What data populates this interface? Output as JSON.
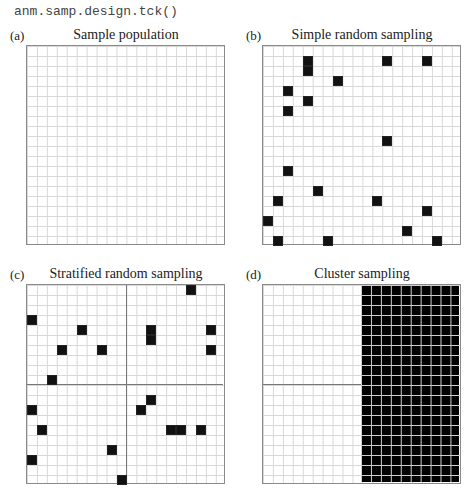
{
  "code_label": "anm.samp.design.tck()",
  "grid": {
    "cols": 20,
    "rows": 20
  },
  "colors": {
    "filled": "#111111",
    "grid_line": "#d8d8d8",
    "frame": "#8a8a8a",
    "divider": "#777777"
  },
  "panels": [
    {
      "letter": "(a)",
      "title": "Sample population",
      "type": "population",
      "cells": []
    },
    {
      "letter": "(b)",
      "title": "Simple random sampling",
      "type": "simple_random",
      "cells": [
        [
          4,
          1
        ],
        [
          4,
          2
        ],
        [
          12,
          1
        ],
        [
          16,
          1
        ],
        [
          7,
          3
        ],
        [
          2,
          4
        ],
        [
          4,
          5
        ],
        [
          2,
          6
        ],
        [
          12,
          9
        ],
        [
          2,
          12
        ],
        [
          5,
          14
        ],
        [
          1,
          15
        ],
        [
          11,
          15
        ],
        [
          16,
          16
        ],
        [
          0,
          17
        ],
        [
          14,
          18
        ],
        [
          1,
          19
        ],
        [
          6,
          19
        ],
        [
          17,
          19
        ]
      ]
    },
    {
      "letter": "(c)",
      "title": "Stratified random sampling",
      "type": "stratified",
      "strata_divider": {
        "col": 10,
        "row": 10
      },
      "cells": [
        [
          16,
          0
        ],
        [
          0,
          3
        ],
        [
          5,
          4
        ],
        [
          12,
          4
        ],
        [
          12,
          5
        ],
        [
          18,
          4
        ],
        [
          3,
          6
        ],
        [
          7,
          6
        ],
        [
          18,
          6
        ],
        [
          2,
          9
        ],
        [
          12,
          11
        ],
        [
          11,
          12
        ],
        [
          0,
          12
        ],
        [
          1,
          14
        ],
        [
          14,
          14
        ],
        [
          15,
          14
        ],
        [
          17,
          14
        ],
        [
          8,
          16
        ],
        [
          0,
          17
        ],
        [
          9,
          19
        ]
      ]
    },
    {
      "letter": "(d)",
      "title": "Cluster sampling",
      "type": "cluster",
      "cluster_divider_row": 10,
      "selected_cluster": {
        "col_start": 10,
        "col_end": 19,
        "row_start": 0,
        "row_end": 19
      }
    }
  ]
}
